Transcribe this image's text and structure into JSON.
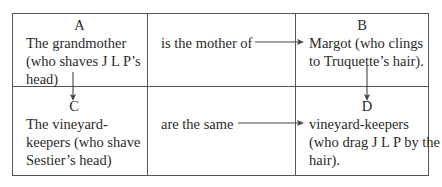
{
  "diagram": {
    "cells": {
      "A": {
        "letter": "A",
        "lines": [
          "The grandmother",
          "(who shaves J L P’s",
          "head)"
        ]
      },
      "relation_top": {
        "text": "is the mother of"
      },
      "B": {
        "letter": "B",
        "lines": [
          "Margot (who clings",
          "to Truquette’s hair)."
        ]
      },
      "C": {
        "letter": "C",
        "lines": [
          "The vineyard-",
          "keepers (who shave",
          "Sestier’s head)"
        ]
      },
      "relation_bottom": {
        "text": "are the same"
      },
      "D": {
        "letter": "D",
        "lines": [
          "vineyard-keepers",
          "(who drag J L P by the",
          "hair)."
        ]
      }
    },
    "arrows": [
      {
        "from": "relation_top",
        "to": "B",
        "direction": "right"
      },
      {
        "from": "A",
        "to": "C",
        "direction": "down"
      },
      {
        "from": "B",
        "to": "D",
        "direction": "down"
      },
      {
        "from": "relation_bottom",
        "to": "D",
        "direction": "right"
      }
    ],
    "line_color": "#555555",
    "text_color": "#2a2a2a"
  }
}
